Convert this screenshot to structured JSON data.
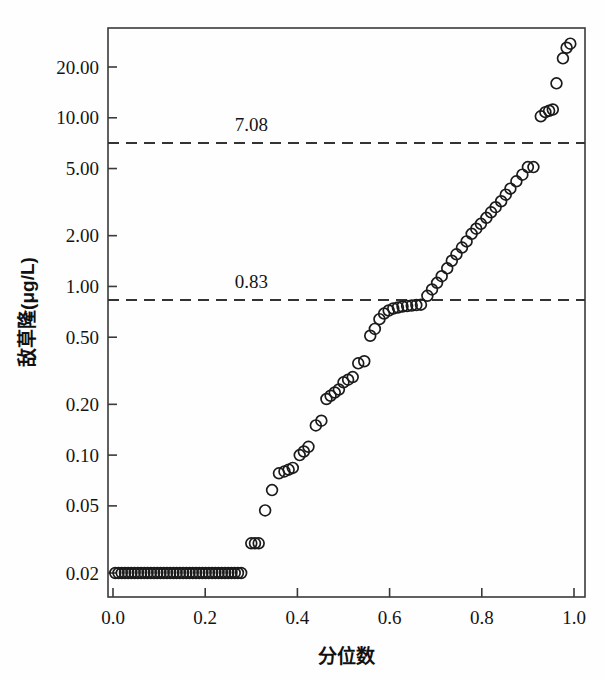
{
  "chart_data": {
    "type": "scatter",
    "title": "",
    "subtitle": "",
    "xlabel": "分位数",
    "ylabel": "敌草隆(μg/L)",
    "xlim": [
      0.0,
      1.0
    ],
    "ylim": [
      0.018,
      30.0
    ],
    "yscale": "log",
    "xscale": "linear",
    "grid": false,
    "legend": null,
    "legend_position": "none",
    "marker": "open-circle",
    "xticks": [
      0.0,
      0.2,
      0.4,
      0.6,
      0.8,
      1.0
    ],
    "xticklabels": [
      "0.0",
      "0.2",
      "0.4",
      "0.6",
      "0.8",
      "1.0"
    ],
    "yticks": [
      0.02,
      0.05,
      0.1,
      0.2,
      0.5,
      1.0,
      2.0,
      5.0,
      10.0,
      20.0
    ],
    "yticklabels": [
      "0.02",
      "0.05",
      "0.10",
      "0.20",
      "0.50",
      "1.00",
      "2.00",
      "5.00",
      "10.00",
      "20.00"
    ],
    "annotations": [
      {
        "label": "7.08",
        "value": 7.08,
        "type": "horizontal-reference-line",
        "style": "dashed",
        "label_x": 0.3
      },
      {
        "label": "0.83",
        "value": 0.83,
        "type": "horizontal-reference-line",
        "style": "dashed",
        "label_x": 0.3
      }
    ],
    "series": [
      {
        "name": "敌草隆",
        "x": [
          0.005,
          0.012,
          0.019,
          0.026,
          0.033,
          0.04,
          0.047,
          0.054,
          0.061,
          0.068,
          0.075,
          0.082,
          0.089,
          0.096,
          0.103,
          0.11,
          0.117,
          0.124,
          0.131,
          0.138,
          0.145,
          0.152,
          0.159,
          0.166,
          0.173,
          0.18,
          0.187,
          0.194,
          0.201,
          0.208,
          0.215,
          0.222,
          0.229,
          0.236,
          0.243,
          0.25,
          0.257,
          0.264,
          0.271,
          0.278,
          0.3,
          0.308,
          0.316,
          0.33,
          0.345,
          0.36,
          0.372,
          0.381,
          0.39,
          0.405,
          0.414,
          0.424,
          0.44,
          0.452,
          0.463,
          0.472,
          0.481,
          0.49,
          0.5,
          0.51,
          0.52,
          0.532,
          0.545,
          0.558,
          0.568,
          0.578,
          0.588,
          0.598,
          0.608,
          0.618,
          0.628,
          0.638,
          0.648,
          0.658,
          0.668,
          0.682,
          0.692,
          0.703,
          0.713,
          0.725,
          0.735,
          0.745,
          0.757,
          0.767,
          0.778,
          0.788,
          0.798,
          0.81,
          0.82,
          0.83,
          0.842,
          0.852,
          0.862,
          0.875,
          0.888,
          0.9,
          0.912,
          0.928,
          0.938,
          0.946,
          0.954,
          0.962,
          0.976,
          0.984,
          0.992
        ],
        "y": [
          0.02,
          0.02,
          0.02,
          0.02,
          0.02,
          0.02,
          0.02,
          0.02,
          0.02,
          0.02,
          0.02,
          0.02,
          0.02,
          0.02,
          0.02,
          0.02,
          0.02,
          0.02,
          0.02,
          0.02,
          0.02,
          0.02,
          0.02,
          0.02,
          0.02,
          0.02,
          0.02,
          0.02,
          0.02,
          0.02,
          0.02,
          0.02,
          0.02,
          0.02,
          0.02,
          0.02,
          0.02,
          0.02,
          0.02,
          0.02,
          0.03,
          0.03,
          0.03,
          0.047,
          0.062,
          0.078,
          0.08,
          0.082,
          0.084,
          0.1,
          0.105,
          0.112,
          0.15,
          0.16,
          0.215,
          0.225,
          0.235,
          0.245,
          0.27,
          0.28,
          0.29,
          0.35,
          0.36,
          0.51,
          0.56,
          0.64,
          0.69,
          0.72,
          0.74,
          0.75,
          0.76,
          0.765,
          0.77,
          0.775,
          0.78,
          0.88,
          0.96,
          1.05,
          1.15,
          1.28,
          1.42,
          1.55,
          1.7,
          1.85,
          2.05,
          2.2,
          2.35,
          2.55,
          2.75,
          2.95,
          3.2,
          3.5,
          3.8,
          4.2,
          4.6,
          5.1,
          5.1,
          10.2,
          10.8,
          11.0,
          11.2,
          16.0,
          22.5,
          26.0,
          27.5
        ]
      }
    ]
  },
  "axes": {
    "y_title": "敌草隆(μg/L)",
    "x_title": "分位数"
  }
}
